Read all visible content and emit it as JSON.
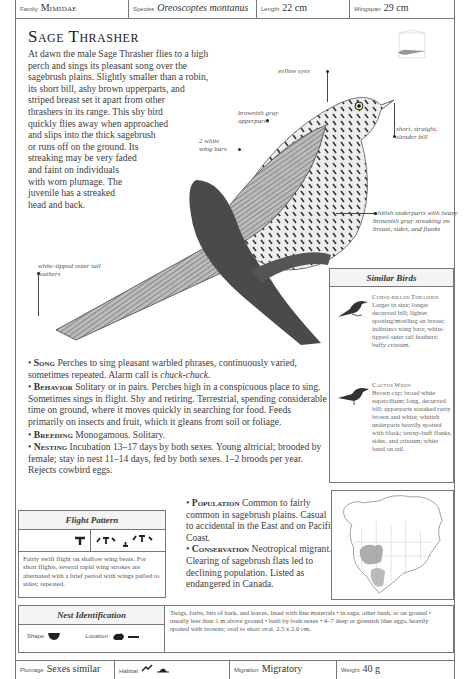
{
  "header": {
    "family_label": "Family",
    "family_value": "Mimidae",
    "species_label": "Species",
    "species_value": "Oreoscoptes montanus",
    "length_label": "Length",
    "length_value": "22 cm",
    "wingspan_label": "Wingspan",
    "wingspan_value": "29 cm"
  },
  "title": "Sage Thrasher",
  "intro_lines": [
    "At dawn the male Sage Thrasher flies to a high",
    "perch and sings its pleasant song over the",
    "sagebrush plains. Slightly smaller than a robin,",
    "its short bill, ashy brown upperparts, and",
    "striped breast set it apart from other",
    "thrashers in its range. This shy bird",
    "quickly flies away when approached",
    "and slips into the thick sagebrush",
    "or runs off on the ground. Its",
    "streaking may be very faded",
    "and faint on individuals",
    "with worn plumage. The",
    "juvenile has a streaked",
    "head and back."
  ],
  "callouts": {
    "yellow_eyes": "yellow eyes",
    "upperparts": "brownish gray upperparts",
    "wing_bars": "2 white wing bars",
    "bill": "short, straight, slender bill",
    "underparts": "whitish underparts with heavy brownish gray streaking on breast, sides, and flanks",
    "tail": "white-tipped outer tail feathers"
  },
  "similar_birds": {
    "title": "Similar Birds",
    "birds": [
      {
        "name": "Curve-billed Thrasher",
        "desc": "Larger in size; longer decurved bill; lighter spotting/mottling on breast; indistinct wing bars; white-tipped outer tail feathers; buffy crissum."
      },
      {
        "name": "Cactus Wren",
        "desc": "Brown cap; broad white supercilium; long, decurved bill; upperparts streaked rusty brown and white; whitish underparts heavily spotted with black; tawny-buff flanks, sides, and crissum; white band on tail."
      }
    ]
  },
  "sections": {
    "song_label": "Song",
    "song_text": "Perches to sing pleasant warbled phrases, continuously varied, sometimes repeated. Alarm call is",
    "song_call": "chuck-chuck.",
    "behavior_label": "Behavior",
    "behavior_text": "Solitary or in pairs. Perches high in a conspicuous place to sing. Sometimes sings in flight. Shy and retiring. Terrestrial, spending considerable time on ground, where it moves quickly in searching for food. Feeds primarily on insects and fruit, which it gleans from soil or foliage.",
    "breeding_label": "Breeding",
    "breeding_text": "Monogamous. Solitary.",
    "nesting_label": "Nesting",
    "nesting_text": "Incubation 13–17 days by both sexes. Young altricial; brooded by female; stay in nest 11–14 days, fed by both sexes. 1–2 broods per year. Rejects cowbird eggs.",
    "population_label": "Population",
    "population_text": "Common to fairly common in sagebrush plains. Casual to accidental in the East and on Pacific Coast.",
    "conservation_label": "Conservation",
    "conservation_text": "Neotropical migrant. Clearing of sagebrush flats led to declining population. Listed as endangered in Canada."
  },
  "flight_pattern": {
    "title": "Flight Pattern",
    "desc": "Fairly swift flight on shallow wing beats. For short flights, several rapid wing strokes are alternated with a brief period with wings pulled to sides; repeated."
  },
  "nest": {
    "title": "Nest Identification",
    "shape_label": "Shape",
    "location_label": "Location",
    "desc": "Twigs, forbs, bits of bark, and leaves, lined with fine materials • in sage, other bush, or on ground • usually less than 1 m above ground • built by both sexes • 4–7 deep or greenish blue eggs, heavily spotted with browns; oval to short oval, 2.5 x 2.0 cm."
  },
  "footer": {
    "plumage_label": "Plumage",
    "plumage_value": "Sexes similar",
    "habitat_label": "Habitat",
    "migration_label": "Migration",
    "migration_value": "Migratory",
    "weight_label": "Weight",
    "weight_value": "40 g"
  }
}
